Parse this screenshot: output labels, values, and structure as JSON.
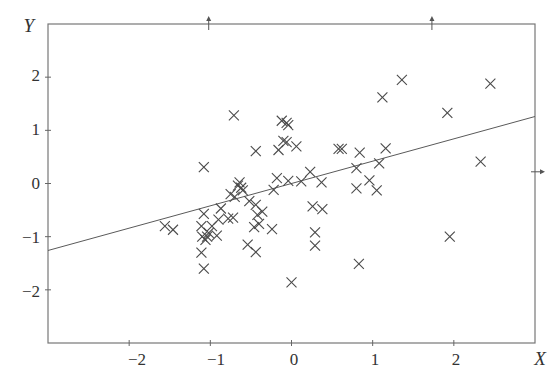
{
  "chart_data": {
    "type": "scatter",
    "title": "",
    "xlabel": "X",
    "ylabel": "Y",
    "xlim": [
      -3,
      3
    ],
    "ylim": [
      -3,
      3
    ],
    "grid": false,
    "legend": null,
    "x_ticks": [
      -2,
      -1,
      0,
      1,
      2
    ],
    "y_ticks": [
      2,
      1,
      0,
      -1,
      -2
    ],
    "x_tick_labels": [
      "−2",
      "−1",
      "0",
      "1",
      "2"
    ],
    "y_tick_labels": [
      "2",
      "1",
      "0",
      "−1",
      "−2"
    ],
    "marker": "x",
    "series": [
      {
        "name": "observations",
        "points": [
          [
            -1.56,
            -0.8
          ],
          [
            -1.46,
            -0.87
          ],
          [
            -1.11,
            -0.8
          ],
          [
            -1.08,
            -0.57
          ],
          [
            -1.1,
            -1.0
          ],
          [
            -1.06,
            -1.06
          ],
          [
            -1.04,
            -1.0
          ],
          [
            -1.02,
            -0.93
          ],
          [
            -1.11,
            -1.3
          ],
          [
            -1.08,
            -1.6
          ],
          [
            -0.92,
            -0.98
          ],
          [
            -0.9,
            -0.68
          ],
          [
            -0.98,
            -0.8
          ],
          [
            -0.87,
            -0.47
          ],
          [
            -0.78,
            -0.66
          ],
          [
            -0.72,
            -0.64
          ],
          [
            -0.75,
            -0.2
          ],
          [
            -0.7,
            -0.25
          ],
          [
            -0.66,
            -0.04
          ],
          [
            -0.62,
            -0.08
          ],
          [
            -0.64,
            0.02
          ],
          [
            -0.6,
            -0.13
          ],
          [
            -0.52,
            -0.33
          ],
          [
            -0.44,
            -0.4
          ],
          [
            -0.42,
            -0.59
          ],
          [
            -0.36,
            -0.53
          ],
          [
            -0.4,
            -0.76
          ],
          [
            -0.46,
            -0.82
          ],
          [
            -0.54,
            -1.15
          ],
          [
            -0.44,
            -1.29
          ],
          [
            -0.24,
            -0.86
          ],
          [
            -0.22,
            -0.12
          ],
          [
            -0.18,
            0.1
          ],
          [
            -1.08,
            0.31
          ],
          [
            -0.71,
            1.28
          ],
          [
            -0.44,
            0.61
          ],
          [
            -0.16,
            0.63
          ],
          [
            -0.1,
            0.8
          ],
          [
            -0.06,
            0.78
          ],
          [
            -0.12,
            1.18
          ],
          [
            -0.06,
            1.14
          ],
          [
            -0.04,
            1.1
          ],
          [
            0.06,
            0.7
          ],
          [
            -0.04,
            0.05
          ],
          [
            0.12,
            0.04
          ],
          [
            0.23,
            0.22
          ],
          [
            0.26,
            -0.43
          ],
          [
            0.38,
            -0.48
          ],
          [
            0.37,
            0.02
          ],
          [
            0.58,
            0.65
          ],
          [
            0.62,
            0.65
          ],
          [
            0.8,
            0.29
          ],
          [
            0.84,
            0.58
          ],
          [
            0.8,
            -0.09
          ],
          [
            0.96,
            0.06
          ],
          [
            1.08,
            0.38
          ],
          [
            1.05,
            -0.13
          ],
          [
            1.16,
            0.66
          ],
          [
            1.12,
            1.62
          ],
          [
            1.36,
            1.95
          ],
          [
            0.29,
            -1.17
          ],
          [
            0.29,
            -0.92
          ],
          [
            0.0,
            -1.86
          ],
          [
            0.83,
            -1.51
          ],
          [
            1.92,
            1.33
          ],
          [
            2.33,
            0.41
          ],
          [
            2.45,
            1.88
          ],
          [
            1.95,
            -1.0
          ]
        ]
      }
    ],
    "regression_line": {
      "x": [
        -3.0,
        3.0
      ],
      "y": [
        -1.26,
        1.26
      ]
    },
    "annotations": {
      "top_arrows_x": [
        -1.02,
        1.73
      ],
      "right_arrow_y": 0.22
    }
  },
  "labels": {
    "x_axis_title": "X",
    "y_axis_title": "Y",
    "x_tick_0": "−2",
    "x_tick_1": "−1",
    "x_tick_2": "0",
    "x_tick_3": "1",
    "x_tick_4": "2",
    "y_tick_0": "2",
    "y_tick_1": "1",
    "y_tick_2": "0",
    "y_tick_3": "−1",
    "y_tick_4": "−2"
  },
  "colors": {
    "axis": "#666666",
    "marker": "#4a4a4a",
    "line": "#5a5a5a",
    "text": "#333333"
  }
}
